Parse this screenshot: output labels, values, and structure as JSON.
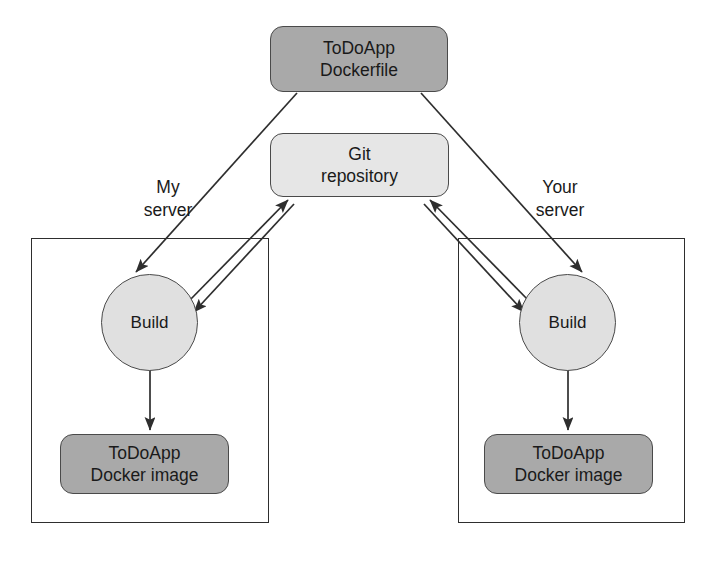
{
  "diagram": {
    "colors": {
      "canvas": "#ffffff",
      "artifact_fill": "#a9a9a9",
      "repository_fill": "#e6e6e6",
      "process_fill": "#e0e0e0",
      "shape_stroke": "#4a4a4a",
      "frame_stroke": "#2e2e2e",
      "edge_stroke": "#2e2e2e",
      "text": "#1a1a1a"
    },
    "nodes": {
      "dockerfile": {
        "id": "todoapp-dockerfile",
        "shape": "rounded-rect",
        "fill": "artifact_fill",
        "line1": "ToDoApp",
        "line2": "Dockerfile"
      },
      "git_repository": {
        "id": "git-repository",
        "shape": "rounded-rect",
        "fill": "repository_fill",
        "line1": "Git",
        "line2": "repository"
      },
      "build_left": {
        "id": "build-my-server",
        "shape": "circle",
        "fill": "process_fill",
        "label": "Build"
      },
      "build_right": {
        "id": "build-your-server",
        "shape": "circle",
        "fill": "process_fill",
        "label": "Build"
      },
      "image_left": {
        "id": "todoapp-docker-image-my-server",
        "shape": "rounded-rect",
        "fill": "artifact_fill",
        "line1": "ToDoApp",
        "line2": "Docker image"
      },
      "image_right": {
        "id": "todoapp-docker-image-your-server",
        "shape": "rounded-rect",
        "fill": "artifact_fill",
        "line1": "ToDoApp",
        "line2": "Docker image"
      }
    },
    "groups": {
      "left_server": {
        "id": "my-server",
        "line1": "My",
        "line2": "server"
      },
      "right_server": {
        "id": "your-server",
        "line1": "Your",
        "line2": "server"
      }
    },
    "edges": [
      {
        "id": "dockerfile-to-build-left",
        "from": "dockerfile",
        "to": "build_left",
        "arrow": "end",
        "style": "solid"
      },
      {
        "id": "dockerfile-to-build-right",
        "from": "dockerfile",
        "to": "build_right",
        "arrow": "end",
        "style": "solid"
      },
      {
        "id": "build-left-to-git",
        "from": "build_left",
        "to": "git_repository",
        "arrow": "end",
        "style": "solid"
      },
      {
        "id": "build-right-to-git",
        "from": "build_right",
        "to": "git_repository",
        "arrow": "end",
        "style": "solid"
      },
      {
        "id": "git-to-build-left",
        "from": "git_repository",
        "to": "build_left",
        "arrow": "end",
        "style": "solid"
      },
      {
        "id": "git-to-build-right",
        "from": "git_repository",
        "to": "build_right",
        "arrow": "end",
        "style": "solid"
      },
      {
        "id": "build-left-to-image-left",
        "from": "build_left",
        "to": "image_left",
        "arrow": "end",
        "style": "solid"
      },
      {
        "id": "build-right-to-image-right",
        "from": "build_right",
        "to": "image_right",
        "arrow": "end",
        "style": "solid"
      }
    ]
  }
}
